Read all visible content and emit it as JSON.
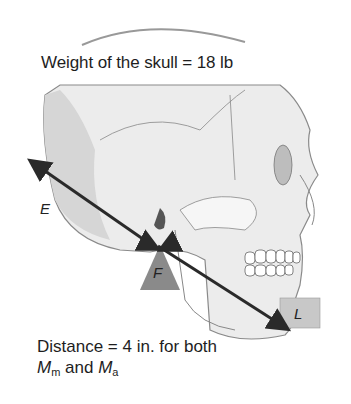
{
  "title": "Weight of the skull = 18 lb",
  "labels": {
    "effort": "E",
    "fulcrum": "F",
    "load": "L"
  },
  "caption": {
    "line1": "Distance = 4 in. for both",
    "m1": "M",
    "m1_sub": "m",
    "and": " and ",
    "m2": "M",
    "m2_sub": "a"
  },
  "colors": {
    "arrow": "#2a2a2a",
    "fulcrum": "#8a8a8a",
    "skull_shade": "#d4d4d4",
    "skull_line": "#7a7a7a"
  }
}
